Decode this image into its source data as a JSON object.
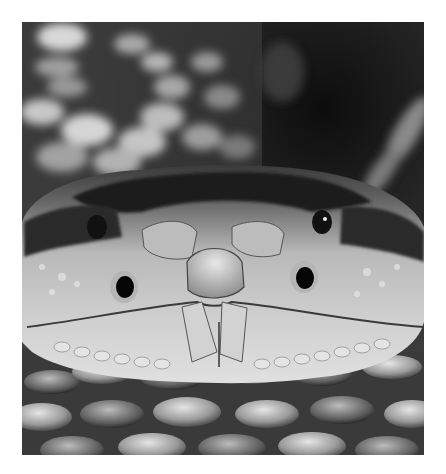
{
  "image": {
    "subject": "Rattlesnake head, frontal close-up",
    "style": "black-and-white photograph",
    "background_color": "#ffffff",
    "frame": {
      "x": 22,
      "y": 22,
      "width": 402,
      "height": 433
    }
  }
}
